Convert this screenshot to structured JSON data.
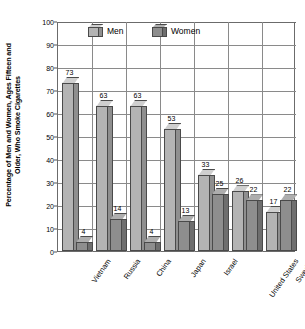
{
  "chart_data": {
    "type": "bar",
    "title": "",
    "subtitle": "",
    "xlabel": "",
    "ylabel": "Percentage of Men and Women, Ages Fifteen and Older, Who Smoke Cigarettes",
    "ylabel_lines": [
      "Percentage of Men and Women, Ages Fifteen and",
      "Older, Who Smoke Cigarettes"
    ],
    "categories": [
      "Vietnam",
      "Russia",
      "China",
      "Japan",
      "Israel",
      "United States",
      "Sweden"
    ],
    "series": [
      {
        "name": "Men",
        "values": [
          73,
          63,
          63,
          53,
          33,
          26,
          17
        ],
        "color": "#b4b4b4"
      },
      {
        "name": "Women",
        "values": [
          4,
          14,
          4,
          13,
          25,
          22,
          22
        ],
        "color": "#8e8e8e"
      }
    ],
    "ylim": [
      0,
      100
    ],
    "yticks": [
      0,
      10,
      20,
      30,
      40,
      50,
      60,
      70,
      80,
      90,
      100
    ],
    "ytick_labels": [
      "0",
      "10",
      "20",
      "30",
      "40",
      "50",
      "60",
      "70",
      "80",
      "90",
      "100"
    ],
    "grid": true,
    "grid_axes": "both",
    "legend_position": "top-inside",
    "legend_entries": [
      "Men",
      "Women"
    ],
    "bar_style": "3d-column",
    "background": "#ffffff",
    "axis_color": "#6b6b6b",
    "grid_color": "#8a8a8a"
  }
}
